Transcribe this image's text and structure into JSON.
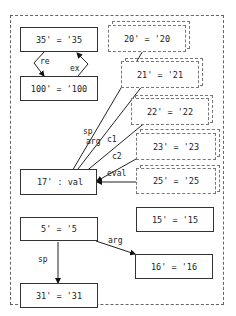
{
  "diagram": {
    "nodes": {
      "n35": {
        "label": "35' = '35",
        "style": "solid"
      },
      "n100": {
        "label": "100' = '100",
        "style": "solid"
      },
      "n20": {
        "label": "20' = '20",
        "style": "dotted"
      },
      "n21": {
        "label": "21' = '21",
        "style": "dotted"
      },
      "n22": {
        "label": "22' = '22",
        "style": "dotted"
      },
      "n23": {
        "label": "23' = '23",
        "style": "dotted"
      },
      "n25": {
        "label": "25' = '25",
        "style": "dotted"
      },
      "n17": {
        "label": "17' : val",
        "style": "solid"
      },
      "n15": {
        "label": "15' = '15",
        "style": "solid"
      },
      "n5": {
        "label": "5' = '5",
        "style": "solid"
      },
      "n16": {
        "label": "16' = '16",
        "style": "solid"
      },
      "n31": {
        "label": "31' = '31",
        "style": "solid"
      }
    },
    "edges": [
      {
        "from": "35'",
        "to": "100'",
        "label": "re"
      },
      {
        "from": "100'",
        "to": "35'",
        "label": "ex"
      },
      {
        "from": "20'",
        "to": "17'",
        "label": "sp"
      },
      {
        "from": "21'",
        "to": "17'",
        "label": "arg"
      },
      {
        "from": "22'",
        "to": "17'",
        "label": "c1"
      },
      {
        "from": "23'",
        "to": "17'",
        "label": "c2"
      },
      {
        "from": "25'",
        "to": "17'",
        "label": "eval"
      },
      {
        "from": "5'",
        "to": "31'",
        "label": "sp"
      },
      {
        "from": "5'",
        "to": "16'",
        "label": "arg"
      }
    ],
    "edge_labels": {
      "re": "re",
      "ex": "ex",
      "sp1": "sp",
      "arg1": "arg",
      "c1": "c1",
      "c2": "c2",
      "eval": "eval",
      "sp2": "sp",
      "arg2": "arg"
    }
  }
}
